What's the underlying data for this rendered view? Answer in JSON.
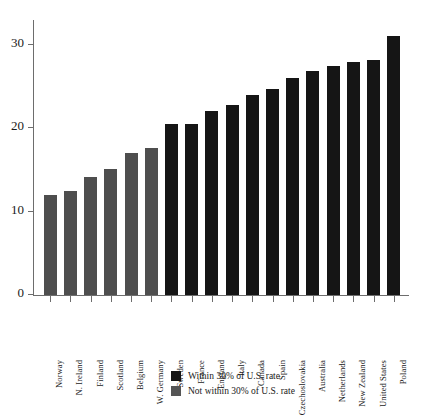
{
  "chart_data": {
    "type": "bar",
    "title": "",
    "subtitle": "",
    "xlabel": "",
    "ylabel": "",
    "ylim": [
      0,
      33
    ],
    "yticks": [
      0,
      10,
      20,
      30
    ],
    "grid": false,
    "legend_position": "bottom-center",
    "categories": [
      "Norway",
      "N. Ireland",
      "Finland",
      "Scotland",
      "Belgium",
      "W. Germany",
      "Sweden",
      "France",
      "England",
      "Italy",
      "Canada",
      "Spain",
      "Czechoslovakia",
      "Australia",
      "Netherlands",
      "New Zealand",
      "United States",
      "Poland"
    ],
    "values": [
      12.0,
      12.5,
      14.2,
      15.1,
      17.0,
      17.7,
      20.5,
      20.5,
      22.1,
      22.8,
      24.0,
      24.7,
      26.0,
      26.9,
      27.5,
      28.0,
      28.2,
      31.1
    ],
    "groups": [
      "notwithin",
      "notwithin",
      "notwithin",
      "notwithin",
      "notwithin",
      "notwithin",
      "within",
      "within",
      "within",
      "within",
      "within",
      "within",
      "within",
      "within",
      "within",
      "within",
      "within",
      "within"
    ],
    "legend": [
      {
        "key": "within",
        "label": "Within 30% of U.S. rate",
        "color": "#151515"
      },
      {
        "key": "notwithin",
        "label": "Not within 30% of U.S. rate",
        "color": "#555555"
      }
    ]
  }
}
